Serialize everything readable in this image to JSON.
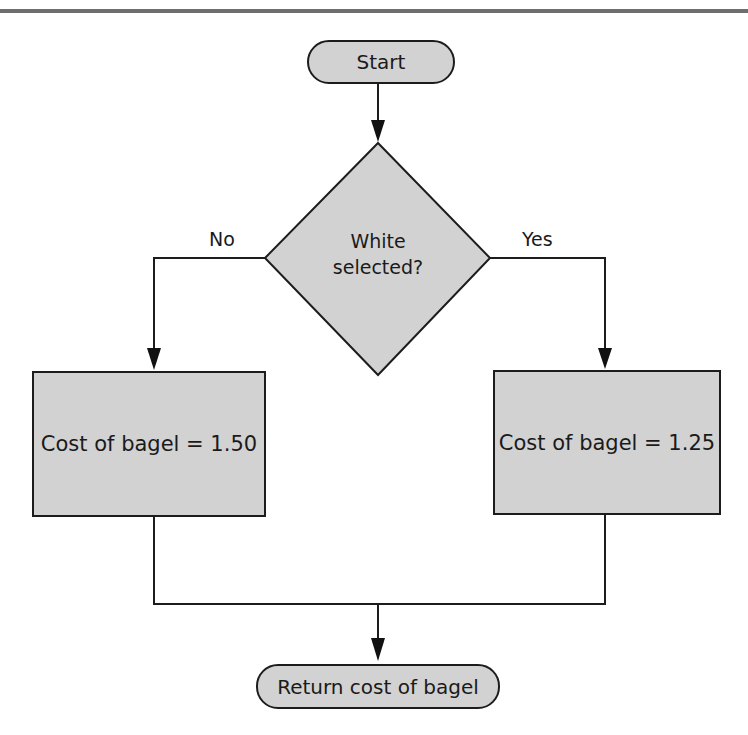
{
  "diagram": {
    "type": "flowchart",
    "colors": {
      "node_fill": "#d2d2d2",
      "stroke": "#1c1c1c",
      "rule": "#6e6e6e"
    },
    "nodes": {
      "start": {
        "shape": "terminal",
        "label": "Start"
      },
      "decision": {
        "shape": "diamond",
        "label_line1": "White",
        "label_line2": "selected?"
      },
      "no_branch": {
        "shape": "process",
        "label": "Cost of bagel = 1.50"
      },
      "yes_branch": {
        "shape": "process",
        "label": "Cost of bagel = 1.25"
      },
      "end": {
        "shape": "terminal",
        "label": "Return cost of bagel"
      }
    },
    "edges": [
      {
        "from": "start",
        "to": "decision",
        "label": ""
      },
      {
        "from": "decision",
        "to": "no_branch",
        "label": "No"
      },
      {
        "from": "decision",
        "to": "yes_branch",
        "label": "Yes"
      },
      {
        "from": "no_branch",
        "to": "end",
        "label": ""
      },
      {
        "from": "yes_branch",
        "to": "end",
        "label": ""
      }
    ],
    "labels": {
      "no": "No",
      "yes": "Yes"
    }
  }
}
